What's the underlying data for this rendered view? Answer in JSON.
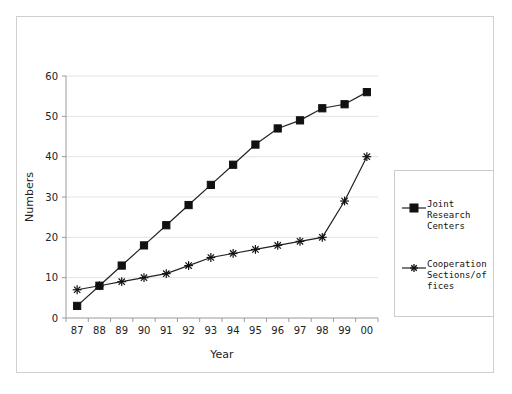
{
  "chart_data": {
    "type": "line",
    "title": "",
    "xlabel": "Year",
    "ylabel": "Numbers",
    "categories": [
      "87",
      "88",
      "89",
      "90",
      "91",
      "92",
      "93",
      "94",
      "95",
      "96",
      "97",
      "98",
      "99",
      "00"
    ],
    "series": [
      {
        "name": "Joint Research Centers",
        "marker": "square",
        "color": "#111111",
        "values": [
          3,
          8,
          13,
          18,
          23,
          28,
          33,
          38,
          43,
          47,
          49,
          52,
          53,
          56
        ]
      },
      {
        "name": "Cooperation Sections/offices",
        "marker": "asterisk",
        "color": "#111111",
        "values": [
          7,
          8,
          9,
          10,
          11,
          13,
          15,
          16,
          17,
          18,
          19,
          20,
          29,
          40
        ]
      }
    ],
    "yticks": [
      0,
      10,
      20,
      30,
      40,
      50,
      60
    ],
    "ylim": [
      0,
      60
    ],
    "grid": true,
    "legend_position": "right"
  },
  "axes": {
    "y_title": "Numbers",
    "x_title": "Year",
    "y_tick_labels": [
      "0",
      "10",
      "20",
      "30",
      "40",
      "50",
      "60"
    ],
    "x_tick_labels": [
      "87",
      "88",
      "89",
      "90",
      "91",
      "92",
      "93",
      "94",
      "95",
      "96",
      "97",
      "98",
      "99",
      "00"
    ]
  },
  "legend": {
    "entries": [
      {
        "marker_name": "square-marker",
        "label_lines": [
          "Joint",
          "Research",
          "Centers"
        ],
        "label": "Joint Research Centers"
      },
      {
        "marker_name": "asterisk-marker",
        "label_lines": [
          "Cooperation",
          "Sections/of",
          "fices"
        ],
        "label": "Cooperation Sections/offices"
      }
    ]
  }
}
